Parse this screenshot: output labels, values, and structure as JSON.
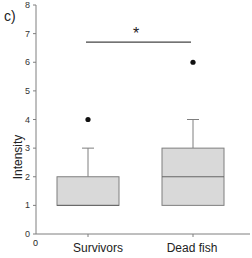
{
  "chart_data": {
    "type": "box",
    "panel_label": "c)",
    "title": "",
    "xlabel": "",
    "ylabel": "Intensity",
    "ylim": [
      0,
      8
    ],
    "yticks": [
      0,
      1,
      2,
      3,
      4,
      5,
      6,
      7,
      8
    ],
    "x_origin_label": "0",
    "categories": [
      "Survivors",
      "Dead fish"
    ],
    "boxes": [
      {
        "name": "Survivors",
        "q1": 1,
        "median": 1,
        "q3": 2,
        "whisker_low": 1,
        "whisker_high": 3,
        "outliers": [
          4
        ]
      },
      {
        "name": "Dead fish",
        "q1": 1,
        "median": 2,
        "q3": 3,
        "whisker_low": 1,
        "whisker_high": 4,
        "outliers": [
          6
        ]
      }
    ],
    "significance": {
      "label": "*",
      "y": 6.7,
      "from": "Survivors",
      "to": "Dead fish"
    },
    "colors": {
      "box_fill": "#d9d9d9",
      "box_stroke": "#7f7f7f",
      "axis": "#7f7f7f",
      "outlier": "#111111"
    }
  }
}
